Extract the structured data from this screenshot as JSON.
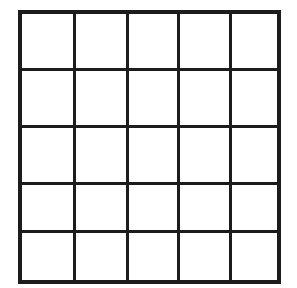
{
  "figure": {
    "kind": "grid-diagram",
    "title": "",
    "caption": "",
    "background_color": "#ffffff",
    "style": "hand-drawn ink grid, empty cells, no labels"
  },
  "grid": {
    "rows": 5,
    "columns": 5,
    "cell_count": 25,
    "line_color": "#1c1c1c",
    "cell_fill_color": "#ffffff",
    "outer_border_width_px": 4,
    "inner_line_width_px": 3,
    "bounds": {
      "left": 20,
      "top": 12,
      "right": 279,
      "bottom": 282
    },
    "vertical_line_x": [
      20,
      74,
      127,
      178,
      230,
      279
    ],
    "horizontal_line_y": [
      12,
      69,
      126,
      183,
      231,
      282
    ],
    "column_widths_px": [
      54,
      53,
      51,
      52,
      49
    ],
    "row_heights_px": [
      57,
      57,
      57,
      48,
      51
    ],
    "cells": [
      [
        {
          "row": 1,
          "col": 1,
          "label": ""
        },
        {
          "row": 1,
          "col": 2,
          "label": ""
        },
        {
          "row": 1,
          "col": 3,
          "label": ""
        },
        {
          "row": 1,
          "col": 4,
          "label": ""
        },
        {
          "row": 1,
          "col": 5,
          "label": ""
        }
      ],
      [
        {
          "row": 2,
          "col": 1,
          "label": ""
        },
        {
          "row": 2,
          "col": 2,
          "label": ""
        },
        {
          "row": 2,
          "col": 3,
          "label": ""
        },
        {
          "row": 2,
          "col": 4,
          "label": ""
        },
        {
          "row": 2,
          "col": 5,
          "label": ""
        }
      ],
      [
        {
          "row": 3,
          "col": 1,
          "label": ""
        },
        {
          "row": 3,
          "col": 2,
          "label": ""
        },
        {
          "row": 3,
          "col": 3,
          "label": ""
        },
        {
          "row": 3,
          "col": 4,
          "label": ""
        },
        {
          "row": 3,
          "col": 5,
          "label": ""
        }
      ],
      [
        {
          "row": 4,
          "col": 1,
          "label": ""
        },
        {
          "row": 4,
          "col": 2,
          "label": ""
        },
        {
          "row": 4,
          "col": 3,
          "label": ""
        },
        {
          "row": 4,
          "col": 4,
          "label": ""
        },
        {
          "row": 4,
          "col": 5,
          "label": ""
        }
      ],
      [
        {
          "row": 5,
          "col": 1,
          "label": ""
        },
        {
          "row": 5,
          "col": 2,
          "label": ""
        },
        {
          "row": 5,
          "col": 3,
          "label": ""
        },
        {
          "row": 5,
          "col": 4,
          "label": ""
        },
        {
          "row": 5,
          "col": 5,
          "label": ""
        }
      ]
    ]
  }
}
